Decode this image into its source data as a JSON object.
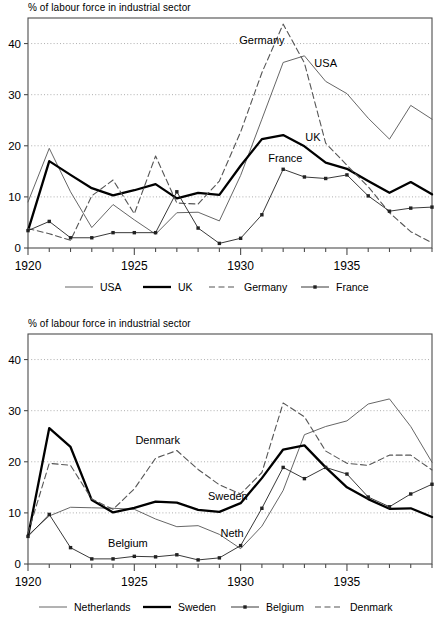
{
  "chart_data": [
    {
      "type": "line",
      "title": "% of labour force in industrial sector",
      "xlabel": "",
      "ylabel": "",
      "xlim": [
        1920,
        1939
      ],
      "ylim": [
        0,
        45
      ],
      "yticks": [
        0,
        10,
        20,
        30,
        40
      ],
      "xticks": [
        1920,
        1925,
        1930,
        1935
      ],
      "grid": true,
      "legend_position": "bottom",
      "x": [
        1920,
        1921,
        1922,
        1923,
        1924,
        1925,
        1926,
        1927,
        1928,
        1929,
        1930,
        1931,
        1932,
        1933,
        1934,
        1935,
        1936,
        1937,
        1938,
        1939
      ],
      "series": [
        {
          "name": "USA",
          "style": "thin-solid",
          "color": "#555555",
          "annotation": "USA",
          "values": [
            9.0,
            19.5,
            11.0,
            4.0,
            8.5,
            5.5,
            2.7,
            6.9,
            7.0,
            5.3,
            14.2,
            25.2,
            36.3,
            37.6,
            32.6,
            30.2,
            25.4,
            21.3,
            27.9,
            25.2
          ]
        },
        {
          "name": "UK",
          "style": "thick-solid",
          "color": "#000000",
          "annotation": "UK",
          "values": [
            3.4,
            17.0,
            14.3,
            11.7,
            10.3,
            11.3,
            12.5,
            9.7,
            10.8,
            10.4,
            16.1,
            21.3,
            22.1,
            19.9,
            16.7,
            15.5,
            13.1,
            10.8,
            12.9,
            10.5
          ]
        },
        {
          "name": "Germany",
          "style": "dashed",
          "color": "#555555",
          "annotation": "Germany",
          "values": [
            3.8,
            2.8,
            1.5,
            10.2,
            13.3,
            6.7,
            18.0,
            8.8,
            8.6,
            13.1,
            22.7,
            34.3,
            43.8,
            36.2,
            20.5,
            16.2,
            12.0,
            6.9,
            3.2,
            1.0
          ]
        },
        {
          "name": "France",
          "style": "marker-line",
          "color": "#222222",
          "annotation": "France",
          "values": [
            3.4,
            5.2,
            2.0,
            2.0,
            3.0,
            3.0,
            3.0,
            11.0,
            3.9,
            0.9,
            1.9,
            6.5,
            15.4,
            13.9,
            13.6,
            14.3,
            10.2,
            7.2,
            7.8,
            8.0
          ]
        }
      ]
    },
    {
      "type": "line",
      "title": "% of labour force in industrial sector",
      "xlabel": "",
      "ylabel": "",
      "xlim": [
        1920,
        1939
      ],
      "ylim": [
        0,
        45
      ],
      "yticks": [
        0,
        10,
        20,
        30,
        40
      ],
      "xticks": [
        1920,
        1925,
        1930,
        1935
      ],
      "grid": true,
      "legend_position": "bottom",
      "x": [
        1920,
        1921,
        1922,
        1923,
        1924,
        1925,
        1926,
        1927,
        1928,
        1929,
        1930,
        1931,
        1932,
        1933,
        1934,
        1935,
        1936,
        1937,
        1938,
        1939
      ],
      "series": [
        {
          "name": "Netherlands",
          "style": "thin-solid",
          "color": "#555555",
          "annotation": "Neth",
          "values": [
            5.6,
            9.4,
            11.1,
            11.0,
            10.9,
            10.7,
            8.8,
            7.3,
            7.5,
            5.8,
            3.0,
            7.4,
            14.4,
            25.3,
            26.9,
            28.0,
            31.3,
            32.3,
            26.9,
            19.9
          ]
        },
        {
          "name": "Sweden",
          "style": "thick-solid",
          "color": "#000000",
          "annotation": "Sweden",
          "values": [
            5.4,
            26.6,
            22.9,
            12.5,
            10.1,
            11.0,
            12.2,
            12.0,
            10.6,
            10.2,
            11.9,
            16.8,
            22.4,
            23.2,
            18.9,
            15.0,
            12.7,
            10.8,
            10.9,
            9.2
          ]
        },
        {
          "name": "Belgium",
          "style": "marker-line",
          "color": "#222222",
          "annotation": "Belgium",
          "values": [
            5.4,
            9.7,
            3.2,
            1.0,
            1.0,
            1.5,
            1.4,
            1.8,
            0.8,
            1.2,
            3.6,
            10.9,
            18.9,
            16.7,
            18.9,
            17.6,
            13.1,
            11.2,
            13.7,
            15.6
          ]
        },
        {
          "name": "Denmark",
          "style": "dashed",
          "color": "#555555",
          "annotation": "Denmark",
          "values": [
            6.0,
            19.7,
            19.3,
            12.7,
            10.7,
            14.7,
            20.7,
            22.2,
            18.5,
            15.5,
            13.7,
            17.9,
            31.5,
            28.8,
            22.1,
            19.7,
            19.3,
            21.3,
            21.3,
            18.4
          ]
        }
      ]
    }
  ],
  "charts": [
    {
      "id": "chart-top",
      "axis_title": "% of labour force in industrial sector",
      "ytick_labels": [
        "0",
        "10",
        "20",
        "30",
        "40"
      ],
      "xtick_labels": [
        "1920",
        "1925",
        "1930",
        "1935"
      ],
      "annotations": [
        "Germany",
        "USA",
        "UK",
        "France"
      ],
      "legend": [
        {
          "label": "USA",
          "style": "thin-solid"
        },
        {
          "label": "UK",
          "style": "thick-solid"
        },
        {
          "label": "Germany",
          "style": "dashed"
        },
        {
          "label": "France",
          "style": "marker-line"
        }
      ]
    },
    {
      "id": "chart-bottom",
      "axis_title": "% of labour force in industrial sector",
      "ytick_labels": [
        "0",
        "10",
        "20",
        "30",
        "40"
      ],
      "xtick_labels": [
        "1920",
        "1925",
        "1930",
        "1935"
      ],
      "annotations": [
        "Denmark",
        "Sweden",
        "Neth",
        "Belgium"
      ],
      "legend": [
        {
          "label": "Netherlands",
          "style": "thin-solid"
        },
        {
          "label": "Sweden",
          "style": "thick-solid"
        },
        {
          "label": "Belgium",
          "style": "marker-line"
        },
        {
          "label": "Denmark",
          "style": "dashed"
        }
      ]
    }
  ],
  "colors": {
    "thin_line": "#555555",
    "thick_line": "#000000",
    "dashed_line": "#555555",
    "marker_line": "#222222",
    "axis": "#4d4d4d",
    "grid": "#9a9a9a"
  }
}
